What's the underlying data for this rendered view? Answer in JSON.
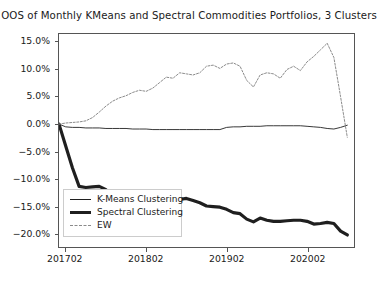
{
  "chart_data": {
    "type": "line",
    "title": "OOS of Monthly KMeans and Spectral Commodities Portfolios, 3 Clusters",
    "xlabel": "",
    "ylabel": "",
    "grid": false,
    "legend_position": "lower left",
    "xlim": [
      0,
      44
    ],
    "ylim": [
      -22.5,
      16.5
    ],
    "yticks": [
      15.0,
      10.0,
      5.0,
      0.0,
      -5.0,
      -10.0,
      -15.0,
      -20.0
    ],
    "ytick_labels": [
      "15.0%",
      "10.0%",
      "5.0%",
      "0.0%",
      "-5.0%",
      "-10.0%",
      "-15.0%",
      "-20.0%"
    ],
    "xticks": [
      1,
      13,
      25,
      37
    ],
    "xtick_labels": [
      "201702",
      "201802",
      "201902",
      "202002"
    ],
    "x": [
      0,
      1,
      2,
      3,
      4,
      5,
      6,
      7,
      8,
      9,
      10,
      11,
      12,
      13,
      14,
      15,
      16,
      17,
      18,
      19,
      20,
      21,
      22,
      23,
      24,
      25,
      26,
      27,
      28,
      29,
      30,
      31,
      32,
      33,
      34,
      35,
      36,
      37,
      38,
      39,
      40,
      41,
      42,
      43
    ],
    "series": [
      {
        "name": "K-Means Clustering",
        "style": "solid-thin",
        "color": "#1f1f1f",
        "values": [
          0.0,
          -0.5,
          -0.6,
          -0.6,
          -0.7,
          -0.7,
          -0.7,
          -0.8,
          -0.8,
          -0.8,
          -0.8,
          -0.9,
          -0.9,
          -0.9,
          -1.0,
          -1.0,
          -1.0,
          -1.0,
          -1.0,
          -1.0,
          -1.0,
          -1.0,
          -1.0,
          -1.0,
          -1.0,
          -0.6,
          -0.5,
          -0.5,
          -0.4,
          -0.4,
          -0.4,
          -0.3,
          -0.3,
          -0.3,
          -0.3,
          -0.3,
          -0.3,
          -0.4,
          -0.5,
          -0.6,
          -0.8,
          -0.9,
          -0.6,
          -0.2
        ]
      },
      {
        "name": "Spectral Clustering",
        "style": "solid-thick",
        "color": "#1f1f1f",
        "values": [
          0.0,
          -4.0,
          -8.0,
          -11.4,
          -11.6,
          -11.5,
          -11.4,
          -12.0,
          -13.6,
          -13.4,
          -12.8,
          -13.5,
          -15.0,
          -13.6,
          -14.0,
          -15.2,
          -14.8,
          -14.2,
          -13.8,
          -13.6,
          -14.0,
          -14.4,
          -15.0,
          -15.1,
          -15.2,
          -15.6,
          -16.2,
          -16.4,
          -17.4,
          -17.9,
          -17.2,
          -17.6,
          -17.8,
          -17.8,
          -17.7,
          -17.6,
          -17.6,
          -17.8,
          -18.3,
          -18.2,
          -18.0,
          -18.2,
          -19.6,
          -20.3
        ]
      },
      {
        "name": "EW",
        "style": "dashed",
        "color": "#8a8a8a",
        "values": [
          0.0,
          0.2,
          0.3,
          0.4,
          0.6,
          1.2,
          2.2,
          3.3,
          4.2,
          4.8,
          5.2,
          5.8,
          6.2,
          6.0,
          6.6,
          7.6,
          8.6,
          8.4,
          9.4,
          9.2,
          9.0,
          9.4,
          10.6,
          10.8,
          10.2,
          11.0,
          11.2,
          10.6,
          8.0,
          6.8,
          9.0,
          9.4,
          9.2,
          8.4,
          10.0,
          10.6,
          9.8,
          11.4,
          12.4,
          13.6,
          14.8,
          12.2,
          5.0,
          -2.4
        ]
      }
    ]
  },
  "legend": {
    "items": [
      {
        "label": "K-Means Clustering"
      },
      {
        "label": "Spectral Clustering"
      },
      {
        "label": "EW"
      }
    ]
  }
}
